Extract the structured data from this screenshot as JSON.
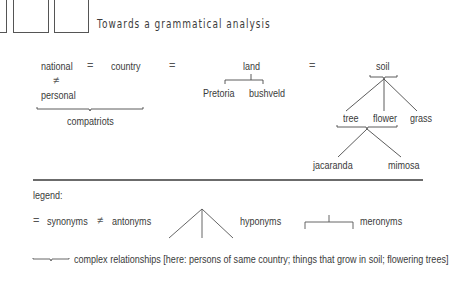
{
  "title": "Towards a grammatical analysis",
  "diagram": {
    "row1": {
      "national": "national",
      "eq1": "=",
      "country": "country",
      "eq2": "=",
      "land": "land",
      "eq3": "=",
      "soil": "soil"
    },
    "neq": "≠",
    "personal": "personal",
    "compatriots": "compatriots",
    "land_meronyms": [
      "Pretoria",
      "bushveld"
    ],
    "soil_hyponyms": [
      "tree",
      "flower",
      "grass"
    ],
    "tree_hyponyms": [
      "jacaranda",
      "mimosa"
    ]
  },
  "legend": {
    "heading": "legend:",
    "synonyms_symbol": "=",
    "synonyms_label": "synonyms",
    "antonyms_symbol": "≠",
    "antonyms_label": "antonyms",
    "hyponyms_label": "hyponyms",
    "meronyms_label": "meronyms",
    "complex_label": "complex relationships [here: persons of same country; things that grow in soil; flowering trees]"
  },
  "colors": {
    "line": "#4a4a4a",
    "text": "#3a3a3a"
  }
}
